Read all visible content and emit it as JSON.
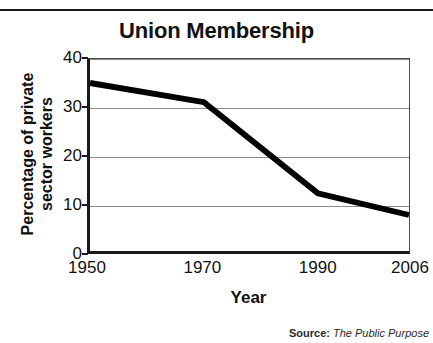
{
  "chart_data": {
    "type": "line",
    "title": "Union Membership",
    "xlabel": "Year",
    "ylabel": "Percentage of private sector workers",
    "ylabel_lines": [
      "Percentage of private",
      "sector workers"
    ],
    "x": [
      1950,
      1970,
      1990,
      2006
    ],
    "categories": [
      "1950",
      "1970",
      "1990",
      "2006"
    ],
    "values": [
      35,
      31,
      12,
      7.5
    ],
    "series": [
      {
        "name": "Percentage of private sector workers",
        "values": [
          35,
          31,
          12,
          7.5
        ]
      }
    ],
    "xlim": [
      1950,
      2006
    ],
    "ylim": [
      0,
      40
    ],
    "ytick_labels": [
      "0",
      "10",
      "20",
      "30",
      "40"
    ],
    "ytick_values": [
      0,
      10,
      20,
      30,
      40
    ],
    "xtick_labels": [
      "1950",
      "1970",
      "1990",
      "2006"
    ],
    "xtick_values": [
      1950,
      1970,
      1990,
      2006
    ],
    "grid": "horizontal",
    "legend": "none",
    "line_color": "#000000",
    "grid_color": "#8c8c8c",
    "axis_color": "#1a1a1a",
    "background": "#ffffff"
  },
  "source": {
    "label": "Source:",
    "text": "The Public Purpose"
  }
}
